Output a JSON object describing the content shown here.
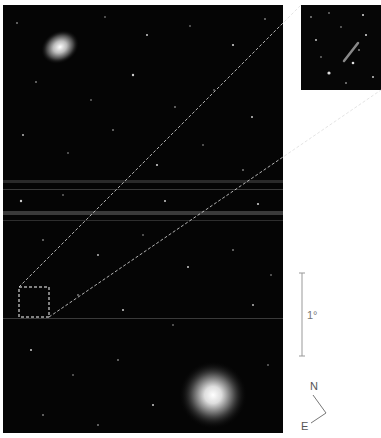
{
  "figure": {
    "main_image": {
      "description": "Wide-field astronomical star field image",
      "background_color": "#050505",
      "features": [
        {
          "type": "galaxy",
          "position": "upper-left",
          "cx": 60,
          "cy": 47
        },
        {
          "type": "bright-star-or-galaxy",
          "position": "lower-center",
          "cx": 213,
          "cy": 397
        }
      ],
      "artifacts": [
        "horizontal stripe near y=183",
        "horizontal stripe near y=215",
        "faint horizontal line near y=318"
      ]
    },
    "selection_box": {
      "x": 19,
      "y": 287,
      "width": 30,
      "height": 30,
      "style": "dashed",
      "color": "#ffffff"
    },
    "inset": {
      "description": "Zoomed view of selected region showing faint elongated object"
    },
    "scale_bar": {
      "label": "1°"
    },
    "compass": {
      "north_label": "N",
      "east_label": "E"
    }
  }
}
